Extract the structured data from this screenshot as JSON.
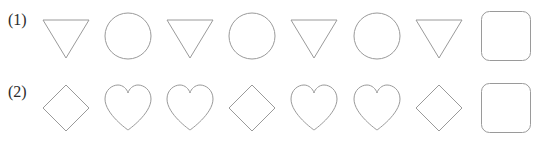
{
  "background_color": "#ffffff",
  "stroke_color": "#9a9a9a",
  "fill_color": "#ffffff",
  "label_color": "#2b2b2b",
  "puzzle": {
    "type": "shape-sequence-pattern",
    "rows": [
      {
        "label": "(1)",
        "pattern_period": 2,
        "shapes": [
          "triangle-down",
          "circle",
          "triangle-down",
          "circle",
          "triangle-down",
          "circle",
          "triangle-down",
          "answer-box"
        ]
      },
      {
        "label": "(2)",
        "pattern_period": 3,
        "shapes": [
          "diamond",
          "heart",
          "heart",
          "diamond",
          "heart",
          "heart",
          "diamond",
          "answer-box"
        ]
      }
    ]
  }
}
